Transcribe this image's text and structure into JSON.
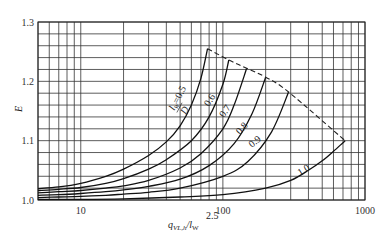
{
  "chart_data": {
    "type": "line",
    "title": "",
    "xlabel": "q_VL,h / l_W^2.5",
    "ylabel": "E",
    "xscale": "log",
    "xlim": [
      5,
      1000
    ],
    "ylim": [
      1.0,
      1.3
    ],
    "x_ticks": [
      10,
      100,
      1000
    ],
    "x_tick_labels": [
      "10",
      "100",
      "1000"
    ],
    "y_ticks": [
      1.0,
      1.1,
      1.2,
      1.3
    ],
    "y_tick_labels": [
      "1.0",
      "1.1",
      "1.2",
      "1.3"
    ],
    "grid": true,
    "series": [
      {
        "name": "l_W/D = 0.5",
        "label": "0.5",
        "x": [
          5,
          7,
          10,
          15,
          20,
          30,
          40,
          50,
          60,
          70,
          78
        ],
        "y": [
          1.019,
          1.022,
          1.028,
          1.04,
          1.052,
          1.075,
          1.098,
          1.125,
          1.16,
          1.205,
          1.255
        ]
      },
      {
        "name": "l_W/D = 0.6",
        "label": "0.6",
        "x": [
          5,
          7,
          10,
          15,
          20,
          30,
          40,
          60,
          80,
          100,
          110
        ],
        "y": [
          1.016,
          1.018,
          1.021,
          1.028,
          1.036,
          1.052,
          1.068,
          1.1,
          1.14,
          1.195,
          1.236
        ]
      },
      {
        "name": "l_W/D = 0.7",
        "label": "0.7",
        "x": [
          5,
          7,
          10,
          15,
          20,
          30,
          50,
          70,
          100,
          120,
          147
        ],
        "y": [
          1.012,
          1.014,
          1.016,
          1.02,
          1.024,
          1.033,
          1.054,
          1.078,
          1.12,
          1.16,
          1.222
        ]
      },
      {
        "name": "l_W/D = 0.8",
        "label": "0.8",
        "x": [
          5,
          7,
          10,
          15,
          20,
          30,
          50,
          80,
          120,
          160,
          200
        ],
        "y": [
          1.008,
          1.009,
          1.011,
          1.014,
          1.017,
          1.023,
          1.035,
          1.058,
          1.095,
          1.145,
          1.207
        ]
      },
      {
        "name": "l_W/D = 0.9",
        "label": "0.9",
        "x": [
          5,
          7,
          10,
          15,
          20,
          30,
          50,
          100,
          150,
          220,
          290
        ],
        "y": [
          1.004,
          1.005,
          1.006,
          1.008,
          1.01,
          1.013,
          1.02,
          1.04,
          1.065,
          1.115,
          1.182
        ]
      },
      {
        "name": "l_W/D = 1.0",
        "label": "1.0",
        "x": [
          5,
          10,
          20,
          50,
          100,
          200,
          300,
          400,
          500,
          600,
          725
        ],
        "y": [
          1.001,
          1.001,
          1.002,
          1.005,
          1.009,
          1.02,
          1.033,
          1.05,
          1.066,
          1.082,
          1.1
        ]
      }
    ],
    "envelope": {
      "name": "limit (dashed)",
      "x": [
        78,
        110,
        147,
        200,
        290,
        725
      ],
      "y": [
        1.255,
        1.236,
        1.222,
        1.207,
        1.182,
        1.1
      ]
    },
    "annotations": [
      "l_W/D = 0.5",
      "0.6",
      "0.7",
      "0.8",
      "0.9",
      "1.0"
    ]
  },
  "labels": {
    "ylabel": "E",
    "xlabel_main": "q",
    "xlabel_sub": "VL,h",
    "xlabel_slash": "/l",
    "xlabel_sub2": "W",
    "xlabel_sup": "2.5",
    "curve_05_num": "l",
    "curve_05_sub": "W",
    "curve_05_eq": "=0.5",
    "curve_05_den": "D"
  }
}
